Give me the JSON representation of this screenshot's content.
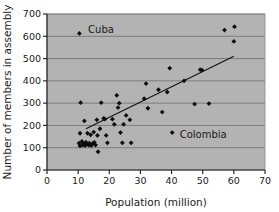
{
  "chart_data": {
    "type": "scatter",
    "title": "",
    "xlabel": "Population (million)",
    "ylabel": "Number of members in assembly",
    "xlim": [
      0,
      70
    ],
    "ylim": [
      0,
      700
    ],
    "xticks": [
      0,
      10,
      20,
      30,
      40,
      50,
      60,
      70
    ],
    "yticks": [
      0,
      100,
      200,
      300,
      400,
      500,
      600,
      700
    ],
    "grid": "horizontal",
    "legend": "none",
    "marker_shape": "diamond",
    "marker_color": "#0d0d0d",
    "plot_background_color": "#b3b3b3",
    "gridline_color": "#6e6e6e",
    "points": [
      [
        10.4,
        613
      ],
      [
        10.8,
        302
      ],
      [
        10.6,
        165
      ],
      [
        10.3,
        120
      ],
      [
        10.6,
        108
      ],
      [
        11.2,
        128
      ],
      [
        11.4,
        112
      ],
      [
        11.8,
        118
      ],
      [
        12.0,
        220
      ],
      [
        12.2,
        110
      ],
      [
        12.5,
        125
      ],
      [
        12.8,
        115
      ],
      [
        13.0,
        165
      ],
      [
        13.4,
        112
      ],
      [
        13.6,
        120
      ],
      [
        14.0,
        158
      ],
      [
        14.2,
        110
      ],
      [
        14.6,
        118
      ],
      [
        15.0,
        170
      ],
      [
        15.2,
        124
      ],
      [
        15.6,
        112
      ],
      [
        16.0,
        225
      ],
      [
        16.2,
        155
      ],
      [
        16.4,
        82
      ],
      [
        17.0,
        185
      ],
      [
        17.4,
        302
      ],
      [
        18.2,
        232
      ],
      [
        18.6,
        228
      ],
      [
        19.0,
        155
      ],
      [
        19.4,
        122
      ],
      [
        21.0,
        228
      ],
      [
        21.6,
        205
      ],
      [
        22.4,
        335
      ],
      [
        22.8,
        280
      ],
      [
        23.2,
        300
      ],
      [
        23.6,
        168
      ],
      [
        24.2,
        122
      ],
      [
        24.6,
        205
      ],
      [
        25.4,
        245
      ],
      [
        26.6,
        225
      ],
      [
        27.0,
        122
      ],
      [
        31.2,
        320
      ],
      [
        31.8,
        388
      ],
      [
        32.4,
        277
      ],
      [
        35.8,
        360
      ],
      [
        37.0,
        260
      ],
      [
        38.6,
        350
      ],
      [
        39.4,
        457
      ],
      [
        40.2,
        168
      ],
      [
        44.0,
        400
      ],
      [
        47.4,
        296
      ],
      [
        49.2,
        450
      ],
      [
        49.8,
        448
      ],
      [
        52.0,
        298
      ],
      [
        57.0,
        628
      ],
      [
        60.2,
        643
      ],
      [
        60.0,
        577
      ]
    ],
    "trendline": {
      "label": "regression line",
      "x_start": 12.5,
      "y_start": 185,
      "x_end": 60.0,
      "y_end": 510
    },
    "annotations": [
      {
        "text": "Cuba",
        "point_x": 10.4,
        "point_y": 613,
        "label_x": 13.2,
        "label_y": 630
      },
      {
        "text": "Colombia",
        "point_x": 40.2,
        "point_y": 168,
        "label_x": 42.6,
        "label_y": 158
      }
    ]
  }
}
